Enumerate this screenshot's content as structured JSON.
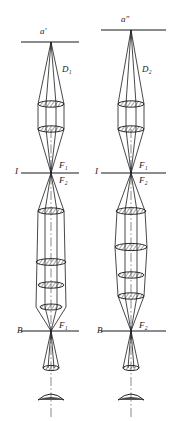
{
  "figure": {
    "type": "optical-ray-diagram",
    "width": 183,
    "height": 421,
    "background_color": "#ffffff",
    "line_color": "#1a1a1a",
    "hatch_color": "#333333"
  },
  "systems": [
    {
      "id": "left",
      "axis_x": 51,
      "labels": {
        "image_point": "a′",
        "aperture": "D₁",
        "intermediate_plane": "I",
        "focus_upper": "F₁",
        "focus_lower": "F₂",
        "object_plane": "B",
        "focus_bottom": "F₁"
      }
    },
    {
      "id": "right",
      "axis_x": 131,
      "labels": {
        "image_point": "a″",
        "aperture": "D₂",
        "intermediate_plane": "I",
        "focus_upper": "F₁",
        "focus_lower": "F₂",
        "object_plane": "B",
        "focus_bottom": "F₂"
      }
    }
  ],
  "label_positions": {
    "left": {
      "image_point": {
        "x": 40,
        "y": 32
      },
      "aperture": {
        "x": 62,
        "y": 70
      },
      "intermediate_plane": {
        "x": 15,
        "y": 172
      },
      "focus_upper": {
        "x": 59,
        "y": 166
      },
      "focus_lower": {
        "x": 59,
        "y": 180
      },
      "object_plane": {
        "x": 17,
        "y": 331
      },
      "focus_bottom": {
        "x": 59,
        "y": 326
      }
    },
    "right": {
      "image_point": {
        "x": 122,
        "y": 20
      },
      "aperture": {
        "x": 142,
        "y": 70
      },
      "intermediate_plane": {
        "x": 95,
        "y": 172
      },
      "focus_upper": {
        "x": 139,
        "y": 166
      },
      "focus_lower": {
        "x": 139,
        "y": 180
      },
      "object_plane": {
        "x": 97,
        "y": 331
      },
      "focus_bottom": {
        "x": 139,
        "y": 326
      }
    }
  },
  "reference_lines": {
    "left": {
      "top_plane": {
        "y": 42,
        "x1": 21,
        "x2": 79
      },
      "middle_plane": {
        "y": 173,
        "x1": 21,
        "x2": 79
      },
      "bottom_plane": {
        "y": 331,
        "x1": 21,
        "x2": 79
      }
    },
    "right": {
      "top_plane": {
        "y": 30,
        "x1": 101,
        "x2": 166
      },
      "middle_plane": {
        "y": 173,
        "x1": 101,
        "x2": 166
      },
      "bottom_plane": {
        "y": 331,
        "x1": 101,
        "x2": 166
      }
    }
  },
  "lens_elements": {
    "left": [
      {
        "group": "upper-objective",
        "y": 104,
        "rx": 13,
        "ry": 3.2
      },
      {
        "group": "upper-objective",
        "y": 129,
        "rx": 13,
        "ry": 3.2
      },
      {
        "group": "lower-objective",
        "y": 211,
        "rx": 13,
        "ry": 3.2
      },
      {
        "group": "lower-objective",
        "y": 262,
        "rx": 15,
        "ry": 3.4
      },
      {
        "group": "lower-objective",
        "y": 285,
        "rx": 13,
        "ry": 3.2
      },
      {
        "group": "lower-objective",
        "y": 307,
        "rx": 11,
        "ry": 3.0
      },
      {
        "group": "condenser",
        "y": 368,
        "rx": 8,
        "ry": 2.6
      }
    ],
    "right": [
      {
        "group": "upper-objective",
        "y": 104,
        "rx": 13,
        "ry": 3.2
      },
      {
        "group": "upper-objective",
        "y": 129,
        "rx": 13,
        "ry": 3.2
      },
      {
        "group": "lower-objective",
        "y": 211,
        "rx": 15,
        "ry": 3.4
      },
      {
        "group": "lower-objective",
        "y": 247,
        "rx": 16,
        "ry": 3.6
      },
      {
        "group": "lower-objective",
        "y": 275,
        "rx": 13,
        "ry": 3.2
      },
      {
        "group": "lower-objective",
        "y": 296,
        "rx": 13,
        "ry": 3.2
      },
      {
        "group": "condenser",
        "y": 368,
        "rx": 8,
        "ry": 2.6
      }
    ]
  },
  "bottom_mirror": {
    "left": {
      "cx": 51,
      "cy": 398,
      "width": 26,
      "height": 7
    },
    "right": {
      "cx": 131,
      "cy": 398,
      "width": 26,
      "height": 7
    }
  }
}
